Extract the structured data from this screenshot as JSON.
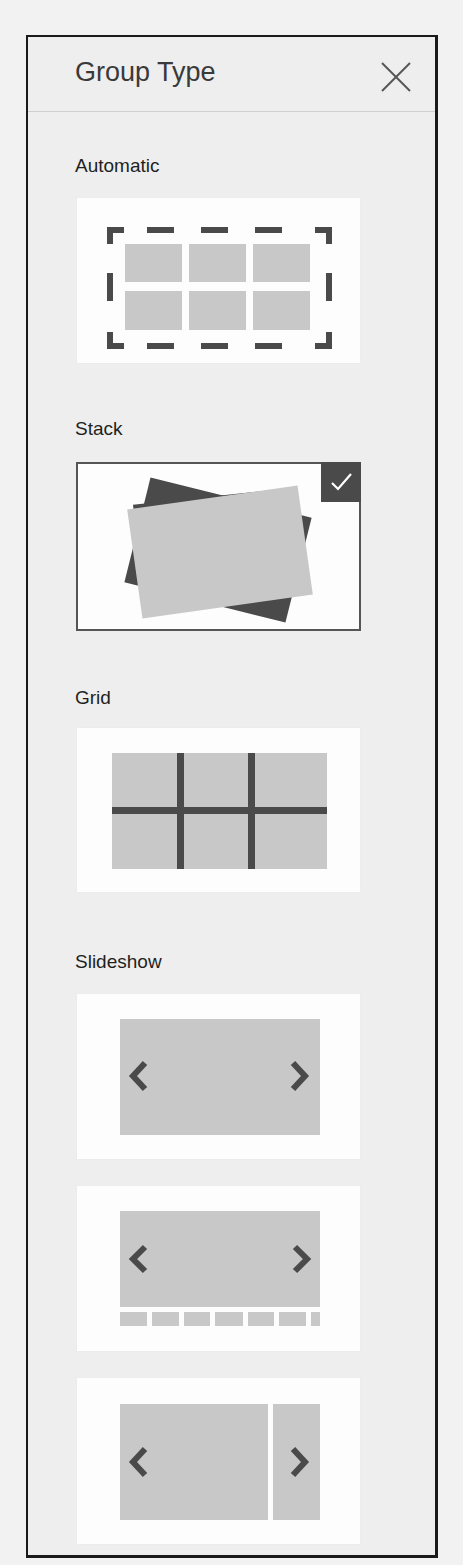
{
  "panel": {
    "title": "Group Type",
    "close_icon": "close-icon"
  },
  "sections": [
    {
      "label": "Automatic",
      "options": [
        {
          "name": "automatic",
          "icon": "automatic-layout-icon",
          "selected": false
        }
      ]
    },
    {
      "label": "Stack",
      "options": [
        {
          "name": "stack",
          "icon": "stack-layout-icon",
          "selected": true,
          "badge_icon": "checkmark-icon"
        }
      ]
    },
    {
      "label": "Grid",
      "options": [
        {
          "name": "grid",
          "icon": "grid-layout-icon",
          "selected": false
        }
      ]
    },
    {
      "label": "Slideshow",
      "options": [
        {
          "name": "slideshow-basic",
          "icon": "slideshow-arrows-icon",
          "selected": false
        },
        {
          "name": "slideshow-thumbnails",
          "icon": "slideshow-thumbnails-icon",
          "selected": false
        },
        {
          "name": "slideshow-peek",
          "icon": "slideshow-peek-icon",
          "selected": false
        }
      ]
    }
  ],
  "colors": {
    "panel_bg": "#eeeeee",
    "card_bg": "#fdfdfd",
    "placeholder_fill": "#c8c8c8",
    "dark_stroke": "#4a4a4a",
    "selected_border": "#555555"
  }
}
